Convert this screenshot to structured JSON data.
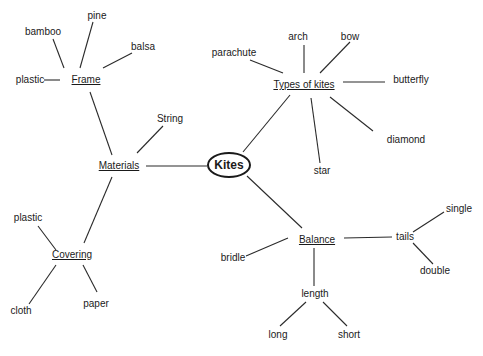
{
  "diagram": {
    "type": "mind-map",
    "root": {
      "id": "kites",
      "label": "Kites",
      "x": 229,
      "y": 165
    },
    "nodes": [
      {
        "id": "materials",
        "label": "Materials",
        "x": 119,
        "y": 166,
        "hub": true
      },
      {
        "id": "string",
        "label": "String",
        "x": 170,
        "y": 119
      },
      {
        "id": "frame",
        "label": "Frame",
        "x": 86,
        "y": 80,
        "hub": true
      },
      {
        "id": "pine",
        "label": "pine",
        "x": 97,
        "y": 16
      },
      {
        "id": "bamboo",
        "label": "bamboo",
        "x": 43,
        "y": 32
      },
      {
        "id": "balsa",
        "label": "balsa",
        "x": 143,
        "y": 47
      },
      {
        "id": "frame_plastic",
        "label": "plastic",
        "x": 30,
        "y": 80
      },
      {
        "id": "covering",
        "label": "Covering",
        "x": 72,
        "y": 255,
        "hub": true
      },
      {
        "id": "cover_plastic",
        "label": "plastic",
        "x": 28,
        "y": 218
      },
      {
        "id": "cloth",
        "label": "cloth",
        "x": 21,
        "y": 311
      },
      {
        "id": "paper",
        "label": "paper",
        "x": 96,
        "y": 304
      },
      {
        "id": "types",
        "label": "Types of kites",
        "x": 304,
        "y": 85,
        "hub": true
      },
      {
        "id": "arch",
        "label": "arch",
        "x": 298,
        "y": 37
      },
      {
        "id": "bow",
        "label": "bow",
        "x": 350,
        "y": 37
      },
      {
        "id": "parachute",
        "label": "parachute",
        "x": 234,
        "y": 53
      },
      {
        "id": "butterfly",
        "label": "butterfly",
        "x": 411,
        "y": 80
      },
      {
        "id": "diamond",
        "label": "diamond",
        "x": 406,
        "y": 140
      },
      {
        "id": "star",
        "label": "star",
        "x": 322,
        "y": 171
      },
      {
        "id": "balance",
        "label": "Balance",
        "x": 317,
        "y": 240,
        "hub": true
      },
      {
        "id": "bridle",
        "label": "bridle",
        "x": 233,
        "y": 258
      },
      {
        "id": "tails",
        "label": "tails",
        "x": 405,
        "y": 237
      },
      {
        "id": "single",
        "label": "single",
        "x": 459,
        "y": 209
      },
      {
        "id": "double",
        "label": "double",
        "x": 435,
        "y": 271
      },
      {
        "id": "length",
        "label": "length",
        "x": 315,
        "y": 294
      },
      {
        "id": "long",
        "label": "long",
        "x": 278,
        "y": 335
      },
      {
        "id": "short",
        "label": "short",
        "x": 349,
        "y": 335
      }
    ],
    "edges": [
      {
        "from": [
          207,
          166
        ],
        "to": [
          146,
          166
        ]
      },
      {
        "from": [
          137,
          153
        ],
        "to": [
          163,
          126
        ]
      },
      {
        "from": [
          112,
          155
        ],
        "to": [
          90,
          92
        ]
      },
      {
        "from": [
          112,
          177
        ],
        "to": [
          84,
          243
        ]
      },
      {
        "from": [
          80,
          68
        ],
        "to": [
          93,
          22
        ]
      },
      {
        "from": [
          64,
          68
        ],
        "to": [
          53,
          39
        ]
      },
      {
        "from": [
          103,
          68
        ],
        "to": [
          132,
          53
        ]
      },
      {
        "from": [
          60,
          80
        ],
        "to": [
          44,
          80
        ]
      },
      {
        "from": [
          56,
          250
        ],
        "to": [
          38,
          226
        ]
      },
      {
        "from": [
          56,
          265
        ],
        "to": [
          29,
          304
        ]
      },
      {
        "from": [
          83,
          265
        ],
        "to": [
          97,
          292
        ]
      },
      {
        "from": [
          243,
          152
        ],
        "to": [
          290,
          95
        ]
      },
      {
        "from": [
          283,
          73
        ],
        "to": [
          250,
          60
        ]
      },
      {
        "from": [
          304,
          73
        ],
        "to": [
          304,
          45
        ]
      },
      {
        "from": [
          320,
          73
        ],
        "to": [
          350,
          42
        ]
      },
      {
        "from": [
          343,
          82
        ],
        "to": [
          385,
          82
        ]
      },
      {
        "from": [
          330,
          97
        ],
        "to": [
          373,
          131
        ]
      },
      {
        "from": [
          311,
          98
        ],
        "to": [
          320,
          163
        ]
      },
      {
        "from": [
          247,
          176
        ],
        "to": [
          302,
          228
        ]
      },
      {
        "from": [
          288,
          238
        ],
        "to": [
          246,
          256
        ]
      },
      {
        "from": [
          344,
          238
        ],
        "to": [
          392,
          237
        ]
      },
      {
        "from": [
          413,
          232
        ],
        "to": [
          444,
          212
        ]
      },
      {
        "from": [
          413,
          243
        ],
        "to": [
          433,
          264
        ]
      },
      {
        "from": [
          314,
          248
        ],
        "to": [
          314,
          286
        ]
      },
      {
        "from": [
          306,
          302
        ],
        "to": [
          280,
          326
        ]
      },
      {
        "from": [
          323,
          302
        ],
        "to": [
          347,
          326
        ]
      }
    ]
  }
}
